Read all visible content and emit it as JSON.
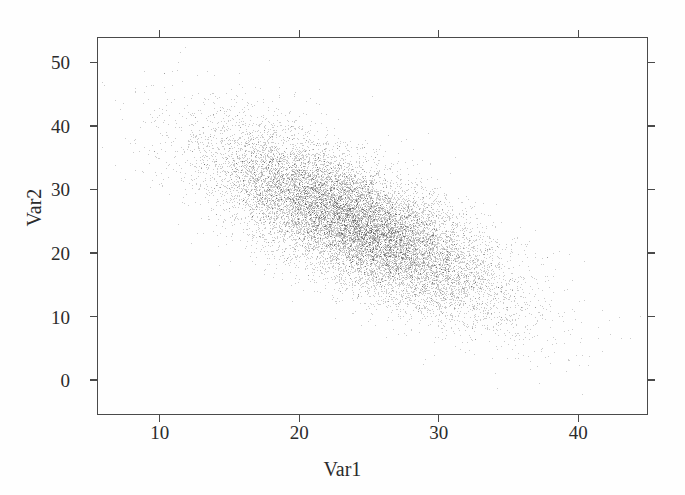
{
  "figure": {
    "background_color": "#fefefe",
    "frame_color": "#4a4a4a",
    "point_color": "#6b6b6b",
    "text_color": "#2b2b2b"
  },
  "chart_data": {
    "type": "scatter",
    "title": "",
    "xlabel": "Var1",
    "ylabel": "Var2",
    "xlim": [
      5.5,
      45.0
    ],
    "ylim": [
      -5.5,
      54.0
    ],
    "xticks": [
      10,
      20,
      30,
      40
    ],
    "yticks": [
      0,
      10,
      20,
      30,
      40,
      50
    ],
    "xtick_labels": [
      "10",
      "20",
      "30",
      "40"
    ],
    "ytick_labels": [
      "0",
      "10",
      "20",
      "30",
      "40",
      "50"
    ],
    "grid": false,
    "legend": null,
    "ticks_on_all_sides": true,
    "tick_direction": "out",
    "marker": "point",
    "marker_size_px": 1,
    "n_points": 15000,
    "distribution": "bivariate-normal",
    "mean_x": 24.0,
    "mean_y": 24.8,
    "std_x": 5.2,
    "std_y": 7.0,
    "correlation": -0.72,
    "observed_x_range": [
      8.0,
      43.0
    ],
    "observed_y_range": [
      -2.0,
      51.0
    ]
  }
}
